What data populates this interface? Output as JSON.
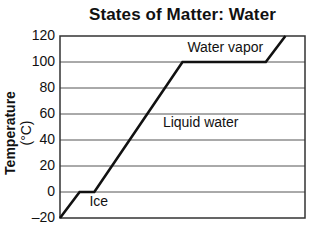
{
  "chart_data": {
    "type": "line",
    "title": "States of Matter: Water",
    "xlabel": "",
    "ylabel": "Temperature",
    "ylabel_unit": "(°C)",
    "ylim": [
      -20,
      120
    ],
    "yticks": [
      -20,
      0,
      20,
      40,
      60,
      80,
      100,
      120
    ],
    "ytick_labels": [
      "–20",
      "0",
      "20",
      "40",
      "60",
      "80",
      "100",
      "120"
    ],
    "grid": true,
    "legend": null,
    "series": [
      {
        "name": "Heating curve of water",
        "x_relative": [
          0,
          0.08,
          0.14,
          0.5,
          0.84,
          0.92
        ],
        "y": [
          -20,
          0,
          0,
          100,
          100,
          120
        ]
      }
    ],
    "annotations": [
      {
        "text": "Ice",
        "x_relative": 0.12,
        "y": -8
      },
      {
        "text": "Liquid water",
        "x_relative": 0.42,
        "y": 53
      },
      {
        "text": "Water vapor",
        "x_relative": 0.52,
        "y": 111
      }
    ]
  }
}
